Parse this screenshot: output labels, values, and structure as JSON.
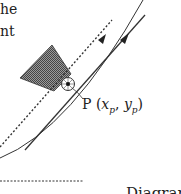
{
  "text_fragments": {
    "line1": "he",
    "line2": "nt"
  },
  "point_label": {
    "name": "P",
    "open": "(",
    "x": "x",
    "x_sub": "p",
    "sep": ", ",
    "y": "y",
    "y_sub": "p",
    "close": ")"
  },
  "caption": "Diagram 2",
  "colors": {
    "line": "#333333",
    "shade": "#777777",
    "background": "#ffffff"
  }
}
